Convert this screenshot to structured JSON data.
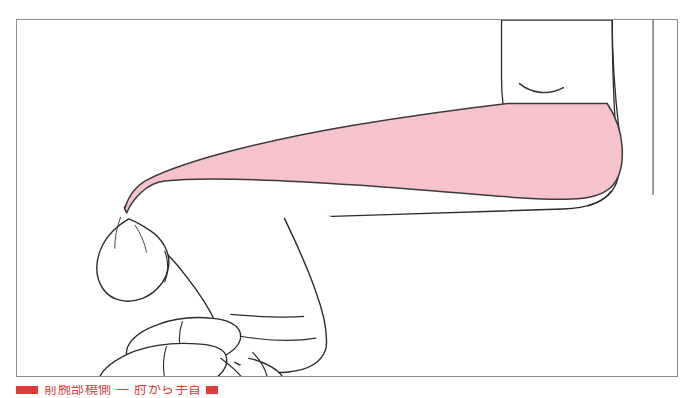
{
  "figure": {
    "frame": {
      "border_color": "#8d8d8d",
      "background_color": "#ffffff"
    },
    "highlight": {
      "label": "highlighted muscle region",
      "fill_color": "#f6c3cd",
      "stroke_color": "#3a3a3a",
      "description": "tapering pink band running along the dorsal/superior surface of the forearm from the wrist to the elbow"
    },
    "outline": {
      "stroke_color": "#2b2b2b",
      "fill_color": "#ffffff"
    },
    "parts": [
      {
        "name": "fingers",
        "label": "curled fingers"
      },
      {
        "name": "thumb",
        "label": "thumb"
      },
      {
        "name": "palm",
        "label": "palm"
      },
      {
        "name": "wrist",
        "label": "wrist"
      },
      {
        "name": "forearm",
        "label": "forearm"
      },
      {
        "name": "elbow",
        "label": "elbow"
      },
      {
        "name": "upper-arm",
        "label": "upper arm"
      },
      {
        "name": "elbow-crease",
        "label": "elbow crease mark"
      }
    ]
  },
  "caption": {
    "marker_color": "#e03b3b",
    "text": "前腕部橈側 — 肘から手首",
    "cropped": "caption is cut off at the bottom edge of the image"
  }
}
